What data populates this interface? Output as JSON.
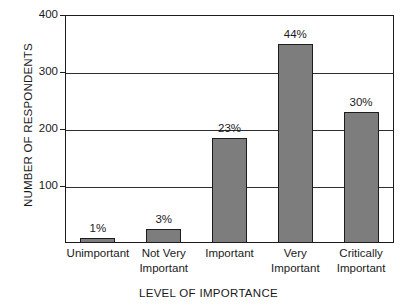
{
  "chart_data": {
    "type": "bar",
    "title": "",
    "xlabel": "LEVEL OF IMPORTANCE",
    "ylabel": "NUMBER OF RESPONDENTS",
    "categories": [
      "Unimportant",
      "Not Very Important",
      "Important",
      "Very Important",
      "Critically Important"
    ],
    "category_lines": [
      [
        "Unimportant"
      ],
      [
        "Not Very",
        "Important"
      ],
      [
        "Important"
      ],
      [
        "Very",
        "Important"
      ],
      [
        "Critically",
        "Important"
      ]
    ],
    "values": [
      8,
      25,
      185,
      350,
      230
    ],
    "data_labels": [
      "1%",
      "3%",
      "23%",
      "44%",
      "30%"
    ],
    "ylim": [
      0,
      400
    ],
    "yticks": [
      100,
      200,
      300,
      400
    ],
    "ytick_labels": [
      "100",
      "200",
      "300",
      "400"
    ],
    "grid": true,
    "legend": false,
    "bar_color": "#7d7d7d",
    "bar_border_color": "#1c1c1c",
    "axis_color": "#1c1c1c",
    "background": "#ffffff"
  }
}
